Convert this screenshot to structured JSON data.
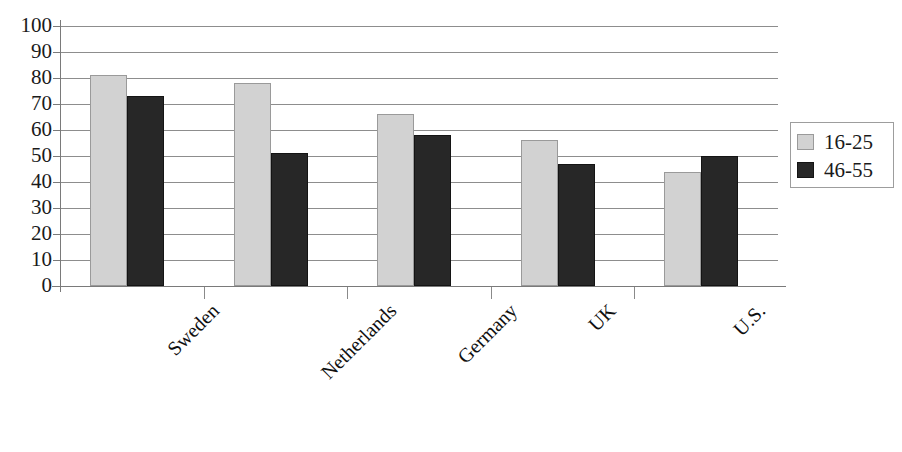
{
  "chart_data": {
    "type": "bar",
    "title": "",
    "subtitle": "",
    "xlabel": "",
    "ylabel": "",
    "ylim": [
      0,
      100
    ],
    "ytick_step": 10,
    "ytick_labels": [
      "100",
      "90",
      "80",
      "70",
      "60",
      "50",
      "40",
      "30",
      "20",
      "10",
      "0"
    ],
    "grid": true,
    "legend_position": "right",
    "categories": [
      "Sweden",
      "Netherlands",
      "Germany",
      "UK",
      "U.S."
    ],
    "series": [
      {
        "name": "16-25",
        "color": "#d2d2d2",
        "values": [
          81,
          78,
          66,
          56,
          44
        ]
      },
      {
        "name": "46-55",
        "color": "#272727",
        "values": [
          73,
          51,
          58,
          47,
          50
        ]
      }
    ]
  },
  "legend": {
    "items": [
      {
        "label": "16-25",
        "swatch": "light"
      },
      {
        "label": "46-55",
        "swatch": "dark"
      }
    ]
  }
}
